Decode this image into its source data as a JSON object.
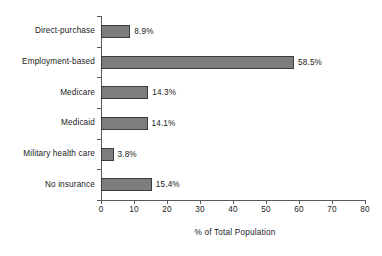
{
  "chart_data": {
    "type": "bar",
    "orientation": "horizontal",
    "title": "",
    "subtitle": "",
    "xlabel": "% of Total Population",
    "ylabel": "",
    "categories": [
      "Direct-purchase",
      "Employment-based",
      "Medicare",
      "Medicaid",
      "Military health care",
      "No insurance"
    ],
    "values": [
      8.9,
      58.5,
      14.3,
      14.1,
      3.8,
      15.4
    ],
    "data_labels": [
      "8.9%",
      "58.5%",
      "14.3%",
      "14.1%",
      "3.8%",
      "15.4%"
    ],
    "xlim": [
      0,
      80
    ],
    "xticks": [
      0,
      10,
      20,
      30,
      40,
      50,
      60,
      70,
      80
    ],
    "xticklabels": [
      "0",
      "10",
      "20",
      "30",
      "40",
      "50",
      "60",
      "70",
      "80"
    ],
    "grid": false,
    "legend": null,
    "bar_color": "#7d7d7d",
    "bar_border_color": "#3d3d3d",
    "axis_color": "#5a5a5a",
    "background_color": "#ffffff"
  },
  "axis": {
    "x_title": "% of Total Population"
  }
}
